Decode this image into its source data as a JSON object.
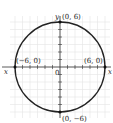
{
  "chart_data": {
    "type": "scatter",
    "title": "",
    "xlabel": "x",
    "ylabel": "y",
    "xlim": [
      -7,
      7
    ],
    "ylim": [
      -7,
      7
    ],
    "grid": true,
    "curve": {
      "shape": "circle",
      "center": [
        0,
        0
      ],
      "radius": 6,
      "equation": "x^2 + y^2 = 36"
    },
    "points": [
      {
        "x": 0,
        "y": 6,
        "label": "(0, 6)"
      },
      {
        "x": -6,
        "y": 0,
        "label": "(−6, 0)"
      },
      {
        "x": 6,
        "y": 0,
        "label": "(6, 0)"
      },
      {
        "x": 0,
        "y": -6,
        "label": "(0, −6)"
      }
    ],
    "origin_label": "0"
  },
  "labels": {
    "x_axis": "x",
    "y_axis": "y",
    "origin": "0",
    "top": "(0, 6)",
    "left": "(−6, 0)",
    "right": "(6, 0)",
    "bottom": "(0, −6)"
  },
  "colors": {
    "curve": "#222222",
    "grid": "#e2e2e2",
    "axis": "#333333"
  }
}
